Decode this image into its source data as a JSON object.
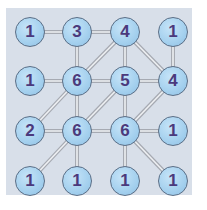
{
  "puzzle": {
    "type": "hashi-bridges",
    "colors": {
      "board_bg": "#d8dfe9",
      "node_fill": "#a4d0ee",
      "node_border": "#5a6e86",
      "number": "#4b3a7c",
      "bridge": "#b8bcc4"
    },
    "nodes": [
      {
        "id": "r1c1",
        "value": "1",
        "x": 30,
        "y": 32
      },
      {
        "id": "r1c2",
        "value": "3",
        "x": 77,
        "y": 32
      },
      {
        "id": "r1c3",
        "value": "4",
        "x": 125,
        "y": 32
      },
      {
        "id": "r1c4",
        "value": "1",
        "x": 173,
        "y": 32
      },
      {
        "id": "r2c1",
        "value": "1",
        "x": 30,
        "y": 81
      },
      {
        "id": "r2c2",
        "value": "6",
        "x": 77,
        "y": 81
      },
      {
        "id": "r2c3",
        "value": "5",
        "x": 125,
        "y": 81
      },
      {
        "id": "r2c4",
        "value": "4",
        "x": 173,
        "y": 81
      },
      {
        "id": "r3c1",
        "value": "2",
        "x": 30,
        "y": 131
      },
      {
        "id": "r3c2",
        "value": "6",
        "x": 77,
        "y": 131
      },
      {
        "id": "r3c3",
        "value": "6",
        "x": 125,
        "y": 131
      },
      {
        "id": "r3c4",
        "value": "1",
        "x": 173,
        "y": 131
      },
      {
        "id": "r4c1",
        "value": "1",
        "x": 30,
        "y": 181
      },
      {
        "id": "r4c2",
        "value": "1",
        "x": 77,
        "y": 181
      },
      {
        "id": "r4c3",
        "value": "1",
        "x": 125,
        "y": 181
      },
      {
        "id": "r4c4",
        "value": "1",
        "x": 173,
        "y": 181
      }
    ],
    "edges": [
      [
        "r1c1",
        "r1c2"
      ],
      [
        "r1c2",
        "r1c3"
      ],
      [
        "r1c2",
        "r2c2"
      ],
      [
        "r1c3",
        "r2c2"
      ],
      [
        "r1c3",
        "r2c3"
      ],
      [
        "r1c3",
        "r2c4"
      ],
      [
        "r1c4",
        "r2c4"
      ],
      [
        "r2c1",
        "r2c2"
      ],
      [
        "r2c2",
        "r2c3"
      ],
      [
        "r2c3",
        "r2c4"
      ],
      [
        "r2c2",
        "r3c1"
      ],
      [
        "r2c2",
        "r3c2"
      ],
      [
        "r2c3",
        "r3c2"
      ],
      [
        "r2c3",
        "r3c3"
      ],
      [
        "r2c4",
        "r3c3"
      ],
      [
        "r3c1",
        "r3c2"
      ],
      [
        "r3c2",
        "r3c3"
      ],
      [
        "r3c3",
        "r3c4"
      ],
      [
        "r3c2",
        "r4c1"
      ],
      [
        "r3c2",
        "r4c2"
      ],
      [
        "r3c3",
        "r4c3"
      ],
      [
        "r3c3",
        "r4c4"
      ]
    ]
  }
}
